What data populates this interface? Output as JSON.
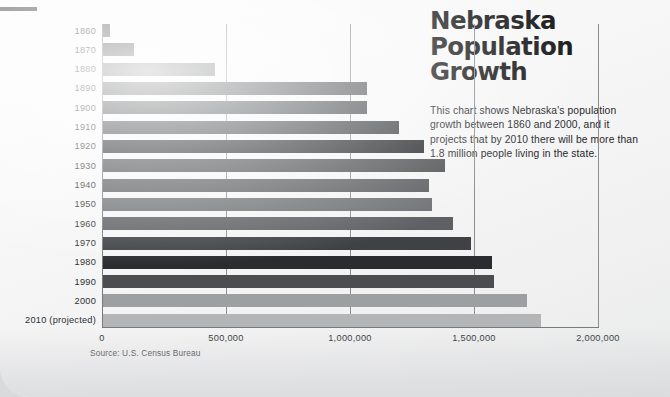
{
  "page": {
    "background_color": "#f5f5f6",
    "rule_color": "#585a5c"
  },
  "header": {
    "title": "Nebraska\nPopulation\nGrowth",
    "description": "This chart shows Nebraska's population growth between 1860 and 2000, and it projects that by 2010 there will be more than 1.8 million people living in the state."
  },
  "source_note": "Source: U.S. Census Bureau",
  "chart_data": {
    "type": "bar",
    "orientation": "horizontal",
    "title": "Nebraska Population Growth",
    "xlabel": "",
    "ylabel": "",
    "xlim": [
      0,
      2000000
    ],
    "ylim": null,
    "grid": true,
    "grid_axis": "x",
    "legend": false,
    "legend_position": "none",
    "xticks": [
      0,
      500000,
      1000000,
      1500000,
      2000000
    ],
    "xtick_labels": [
      "0",
      "500,000",
      "1,000,000",
      "1,500,000",
      "2,000,000"
    ],
    "categories": [
      "1860",
      "1870",
      "1880",
      "1890",
      "1900",
      "1910",
      "1920",
      "1930",
      "1940",
      "1950",
      "1960",
      "1970",
      "1980",
      "1990",
      "2000",
      "2010 (projected)"
    ],
    "values": [
      28800,
      123000,
      452000,
      1063000,
      1066000,
      1192000,
      1296000,
      1378000,
      1316000,
      1326000,
      1411000,
      1483000,
      1570000,
      1578000,
      1711000,
      1768000
    ],
    "bar_colors": [
      "#595b5e",
      "#4a4c4f",
      "#6b6d70",
      "#515356",
      "#46484b",
      "#3c3e41",
      "#26282b",
      "#4e5053",
      "#5b5d60",
      "#6e7073",
      "#5e6063",
      "#3f4144",
      "#2a2c2f",
      "#4b4d50",
      "#9d9fa1",
      "#b3b5b7"
    ],
    "annotations": []
  }
}
